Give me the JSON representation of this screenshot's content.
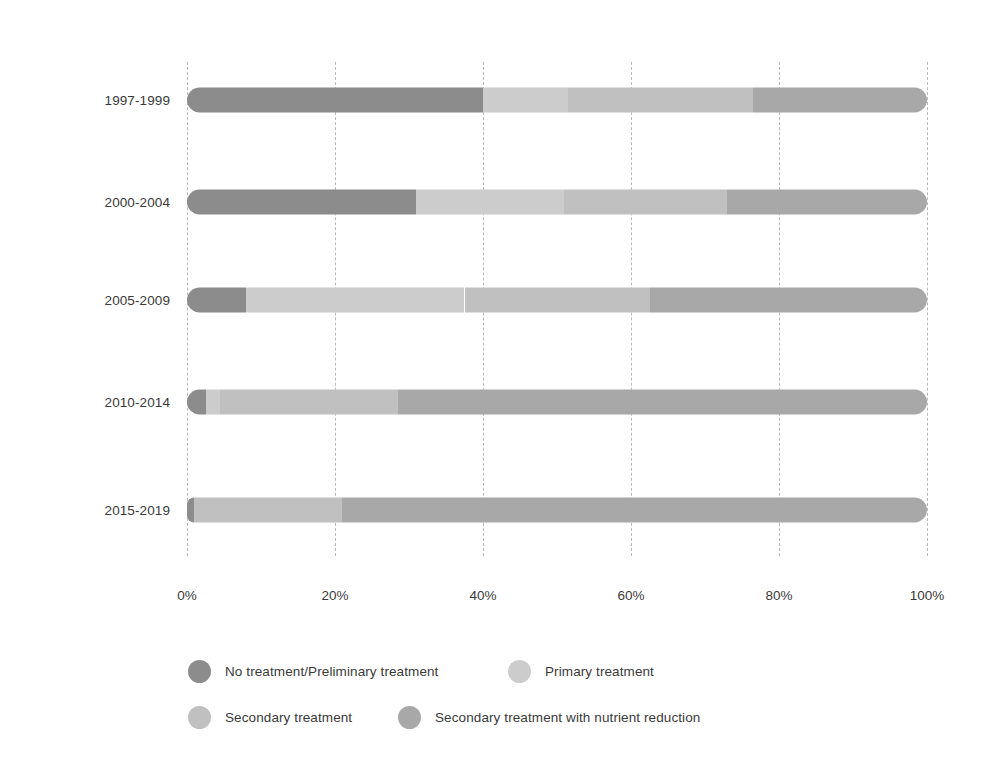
{
  "chart_data": {
    "type": "bar",
    "subtype": "stacked-horizontal-100pct",
    "title": "",
    "subtitle": "",
    "xlabel": "",
    "ylabel": "",
    "xlim": [
      0,
      100
    ],
    "xticks": [
      "0%",
      "20%",
      "40%",
      "60%",
      "80%",
      "100%"
    ],
    "xtick_values": [
      0,
      20,
      40,
      60,
      80,
      100
    ],
    "grid": "vertical-dashed",
    "legend_position": "bottom-left",
    "categories": [
      "1997-1999",
      "2000-2004",
      "2005-2009",
      "2010-2014",
      "2015-2019"
    ],
    "series": [
      {
        "name": "No treatment/Preliminary treatment",
        "color": "#8c8c8c",
        "values": [
          40.0,
          31.0,
          8.0,
          2.5,
          1.0
        ]
      },
      {
        "name": "Primary treatment",
        "color": "#cccccc",
        "values": [
          11.5,
          20.0,
          29.5,
          2.0,
          0.0
        ]
      },
      {
        "name": "Secondary treatment",
        "color": "#c0c0c0",
        "values": [
          25.0,
          22.0,
          25.0,
          24.0,
          20.0
        ]
      },
      {
        "name": "Secondary treatment with nutrient reduction",
        "color": "#a8a8a8",
        "values": [
          23.5,
          27.0,
          37.5,
          71.5,
          79.0
        ]
      }
    ]
  },
  "axis": {
    "y_labels": [
      "1997-1999",
      "2000-2004",
      "2005-2009",
      "2010-2014",
      "2015-2019"
    ],
    "x_labels": [
      "0%",
      "20%",
      "40%",
      "60%",
      "80%",
      "100%"
    ]
  },
  "legend": {
    "items": [
      {
        "label": "No treatment/Preliminary treatment",
        "color": "#8c8c8c"
      },
      {
        "label": "Primary treatment",
        "color": "#cccccc"
      },
      {
        "label": "Secondary treatment",
        "color": "#c0c0c0"
      },
      {
        "label": "Secondary treatment with nutrient reduction",
        "color": "#a8a8a8"
      }
    ]
  },
  "colors": {
    "background": "#ffffff",
    "gridline": "#b9b9b9",
    "text": "#3a3a3a"
  }
}
